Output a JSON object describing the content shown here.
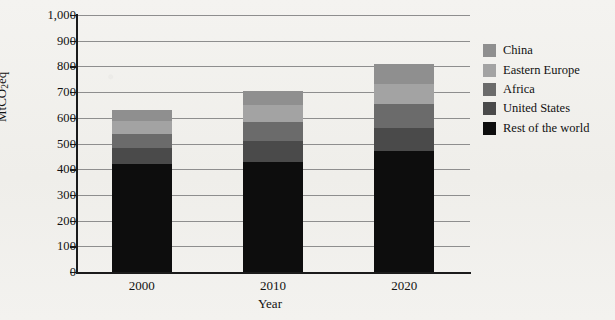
{
  "chart_data": {
    "type": "bar",
    "stacked": true,
    "title": "",
    "xlabel": "Year",
    "ylabel": "MtCO2eq",
    "ylabel_parts": {
      "pre": "MtCO",
      "sub": "2",
      "post": "eq"
    },
    "categories": [
      "2000",
      "2010",
      "2020"
    ],
    "ylim": [
      0,
      1000
    ],
    "ytick_step": 100,
    "yticks": [
      "0",
      "100",
      "200",
      "300",
      "400",
      "500",
      "600",
      "700",
      "800",
      "900",
      "1,000"
    ],
    "grid": true,
    "grid_axis": "y",
    "legend_position": "right",
    "series": [
      {
        "name": "Rest of the world",
        "color": "#0d0d0d",
        "values": [
          420,
          430,
          470
        ]
      },
      {
        "name": "United States",
        "color": "#4a4a4a",
        "values": [
          62,
          78,
          92
        ]
      },
      {
        "name": "Africa",
        "color": "#6b6b6b",
        "values": [
          55,
          75,
          90
        ]
      },
      {
        "name": "Eastern Europe",
        "color": "#a3a3a3",
        "values": [
          50,
          68,
          78
        ]
      },
      {
        "name": "China",
        "color": "#8f8f8f",
        "values": [
          43,
          54,
          80
        ]
      }
    ],
    "totals": [
      730,
      755,
      810
    ],
    "legend_order": [
      "China",
      "Eastern Europe",
      "Africa",
      "United States",
      "Rest of the world"
    ]
  },
  "legend": {
    "items": [
      {
        "label": "China",
        "color": "#8f8f8f"
      },
      {
        "label": "Eastern Europe",
        "color": "#a3a3a3"
      },
      {
        "label": "Africa",
        "color": "#6b6b6b"
      },
      {
        "label": "United States",
        "color": "#4a4a4a"
      },
      {
        "label": "Rest of the world",
        "color": "#0d0d0d"
      }
    ]
  },
  "colors": {
    "axis": "#1b1b1b",
    "grid": "#8e8e8e",
    "background": "#f2f1ee",
    "text": "#111111"
  }
}
